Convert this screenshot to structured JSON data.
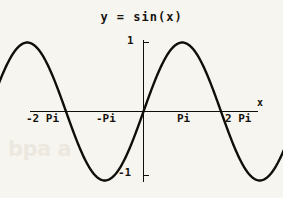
{
  "figure": {
    "title": "y = sin(x)",
    "ghost_artifact": "bpa a"
  },
  "chart_data": {
    "type": "line",
    "title": "y = sin(x)",
    "xlabel": "x",
    "ylabel": "",
    "xlim": [
      -7.33,
      7.33
    ],
    "ylim": [
      -1.35,
      1.35
    ],
    "grid": false,
    "legend": null,
    "x_tick_labels": [
      "-2 Pi",
      "-Pi",
      "Pi",
      "2 Pi"
    ],
    "x_tick_values": [
      -6.2832,
      -3.1416,
      3.1416,
      6.2832
    ],
    "y_tick_labels": [
      "1",
      "-1"
    ],
    "y_tick_values": [
      1,
      -1
    ],
    "series": [
      {
        "name": "sin(x)",
        "color": "#100e0b",
        "x": [
          -6.2832,
          -5.8905,
          -5.4978,
          -5.1051,
          -4.7124,
          -4.3197,
          -3.927,
          -3.5343,
          -3.1416,
          -2.7489,
          -2.3562,
          -1.9635,
          -1.5708,
          -1.1781,
          -0.7854,
          -0.3927,
          0,
          0.3927,
          0.7854,
          1.1781,
          1.5708,
          1.9635,
          2.3562,
          2.7489,
          3.1416,
          3.5343,
          3.927,
          4.3197,
          4.7124,
          5.1051,
          5.4978,
          5.8905,
          6.2832
        ],
        "y": [
          0,
          0.3827,
          0.7071,
          0.9239,
          1,
          0.9239,
          0.7071,
          0.3827,
          0,
          -0.3827,
          -0.7071,
          -0.9239,
          -1,
          -0.9239,
          -0.7071,
          -0.3827,
          0,
          0.3827,
          0.7071,
          0.9239,
          1,
          0.9239,
          0.7071,
          0.3827,
          0,
          -0.3827,
          -0.7071,
          -0.9239,
          -1,
          -0.9239,
          -0.7071,
          -0.3827,
          0
        ]
      }
    ],
    "annotations": {
      "x_axis_arrow_label": "x",
      "max_value": 1,
      "min_value": -1,
      "period": 6.2832,
      "amplitude": 1
    }
  },
  "labels": {
    "neg_two_pi": "-2 Pi",
    "neg_pi": "-Pi",
    "pi": "Pi",
    "two_pi": "2 Pi",
    "x_axis": "x",
    "y_one": "1",
    "y_neg_one": "-1"
  },
  "colors": {
    "background": "#f7f5f0",
    "ink": "#100e0b",
    "ghost": "#ece8df"
  }
}
